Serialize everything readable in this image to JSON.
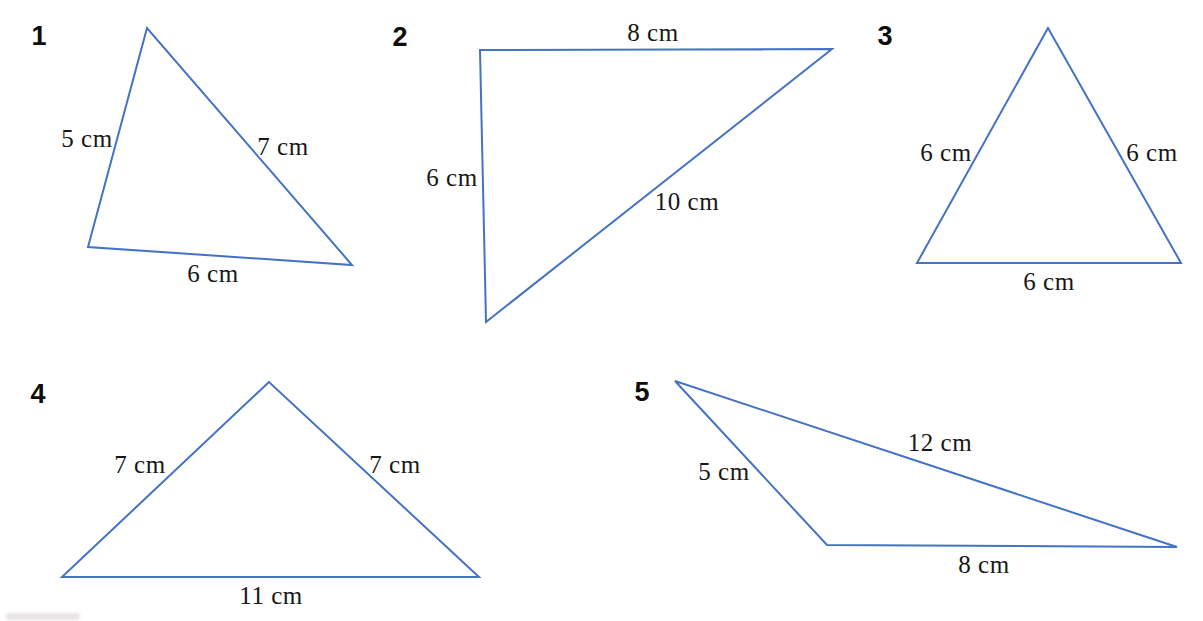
{
  "canvas": {
    "width": 1203,
    "height": 621,
    "background": "#ffffff"
  },
  "style": {
    "line_color": "#4472c4",
    "line_width": 2,
    "label_color": "#171717",
    "number_color": "#0d0d0d"
  },
  "figure_set": {
    "description": "Five numbered triangle figures with labelled side lengths",
    "unit": "cm"
  },
  "triangles": [
    {
      "number": "1",
      "number_pos": {
        "x": 39,
        "y": 36
      },
      "vertices": [
        [
          147,
          28
        ],
        [
          88,
          247
        ],
        [
          352,
          265
        ]
      ],
      "side_labels": [
        {
          "text": "5 cm",
          "x": 87,
          "y": 139
        },
        {
          "text": "7 cm",
          "x": 283,
          "y": 147
        },
        {
          "text": "6 cm",
          "x": 213,
          "y": 274
        }
      ],
      "side_lengths_cm": [
        5,
        7,
        6
      ]
    },
    {
      "number": "2",
      "number_pos": {
        "x": 400,
        "y": 37
      },
      "vertices": [
        [
          480,
          50
        ],
        [
          832,
          49
        ],
        [
          486,
          322
        ]
      ],
      "side_labels": [
        {
          "text": "8 cm",
          "x": 653,
          "y": 33
        },
        {
          "text": "6 cm",
          "x": 452,
          "y": 178
        },
        {
          "text": "10 cm",
          "x": 687,
          "y": 202
        }
      ],
      "side_lengths_cm": [
        8,
        6,
        10
      ]
    },
    {
      "number": "3",
      "number_pos": {
        "x": 885,
        "y": 36
      },
      "vertices": [
        [
          1048,
          28
        ],
        [
          917,
          263
        ],
        [
          1181,
          263
        ]
      ],
      "side_labels": [
        {
          "text": "6 cm",
          "x": 946,
          "y": 153
        },
        {
          "text": "6 cm",
          "x": 1152,
          "y": 153
        },
        {
          "text": "6 cm",
          "x": 1049,
          "y": 282
        }
      ],
      "side_lengths_cm": [
        6,
        6,
        6
      ]
    },
    {
      "number": "4",
      "number_pos": {
        "x": 38,
        "y": 394
      },
      "vertices": [
        [
          269,
          382
        ],
        [
          62,
          577
        ],
        [
          479,
          577
        ]
      ],
      "side_labels": [
        {
          "text": "7 cm",
          "x": 140,
          "y": 465
        },
        {
          "text": "7 cm",
          "x": 395,
          "y": 465
        },
        {
          "text": "11 cm",
          "x": 271,
          "y": 596
        }
      ],
      "side_lengths_cm": [
        7,
        7,
        11
      ]
    },
    {
      "number": "5",
      "number_pos": {
        "x": 642,
        "y": 392
      },
      "vertices": [
        [
          675,
          381
        ],
        [
          827,
          545
        ],
        [
          1177,
          547
        ]
      ],
      "side_labels": [
        {
          "text": "5 cm",
          "x": 724,
          "y": 472
        },
        {
          "text": "12 cm",
          "x": 940,
          "y": 443
        },
        {
          "text": "8 cm",
          "x": 984,
          "y": 565
        }
      ],
      "side_lengths_cm": [
        5,
        12,
        8
      ]
    }
  ]
}
